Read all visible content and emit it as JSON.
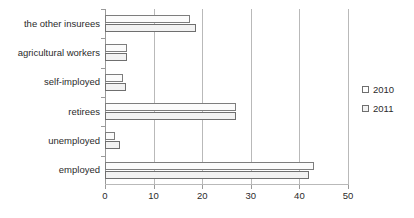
{
  "chart_data": {
    "type": "bar",
    "orientation": "horizontal",
    "title": "",
    "xlabel": "",
    "ylabel": "",
    "xlim": [
      0,
      50
    ],
    "xticks": [
      0,
      10,
      20,
      30,
      40,
      50
    ],
    "grid": true,
    "legend_position": "right",
    "categories": [
      "the other insurees",
      "agricultural workers",
      "self-imployed",
      "retirees",
      "unemployed",
      "employed"
    ],
    "series": [
      {
        "name": "2010",
        "values": [
          17.5,
          4.5,
          3.8,
          27.0,
          2.0,
          43.0
        ]
      },
      {
        "name": "2011",
        "values": [
          18.7,
          4.5,
          4.3,
          27.0,
          3.0,
          42.0
        ]
      }
    ]
  },
  "legend": {
    "items": [
      {
        "label": "2010"
      },
      {
        "label": "2011"
      }
    ]
  },
  "axis": {
    "tick_labels": [
      "0",
      "10",
      "20",
      "30",
      "40",
      "50"
    ]
  },
  "colors": {
    "bar_2010_fill": "#fbfbfb",
    "bar_2011_fill": "#f2f2f2",
    "bar_border": "#7d7d7d",
    "gridline": "#b9b9b9",
    "text": "#2b2b2b",
    "background": "#ffffff"
  }
}
